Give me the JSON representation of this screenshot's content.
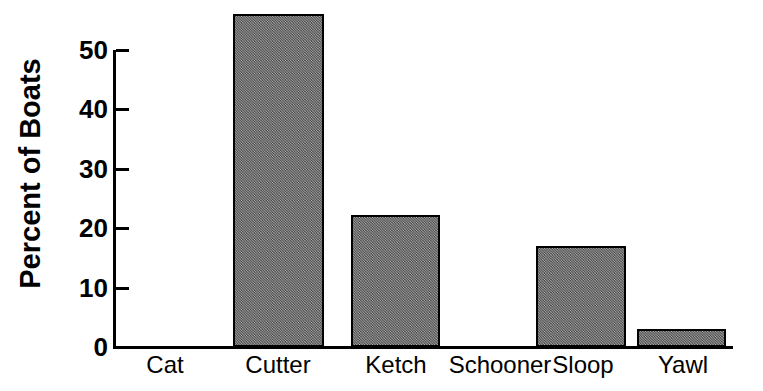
{
  "chart_data": {
    "type": "bar",
    "title": "",
    "xlabel": "",
    "ylabel": "Percent of Boats",
    "categories": [
      "Cat",
      "Cutter",
      "Ketch",
      "Schooner",
      "Sloop",
      "Yawl"
    ],
    "values": [
      0,
      56,
      22.2,
      0,
      17,
      3
    ],
    "ylim": [
      0,
      50
    ],
    "yticks": [
      0,
      10,
      20,
      30,
      40,
      50
    ],
    "ytick_labels": [
      "0",
      "10",
      "20",
      "30",
      "40",
      "50"
    ],
    "grid": false,
    "legend": null,
    "bar_fill_color": "#848484",
    "bar_edge_color": "#000000",
    "axis_color": "#000000",
    "background_color": "#ffffff",
    "note": "Bars exceed the top y tick; Cutter is drawn above the 50 tick. Cat and Schooner have zero height."
  }
}
